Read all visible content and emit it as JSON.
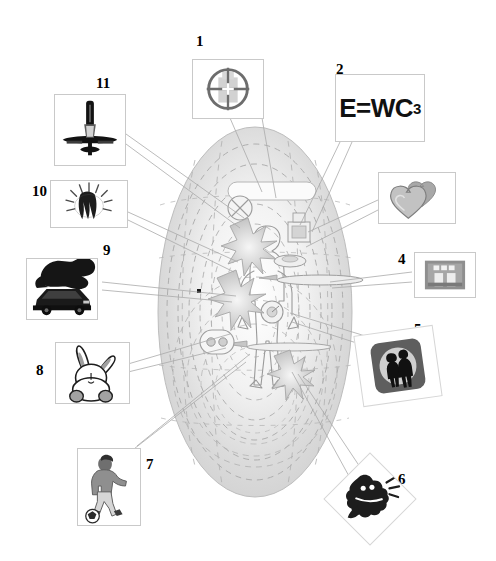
{
  "diagram": {
    "center": {
      "name": "human-figure-oval-field",
      "description": "Faint human figure standing inside nested dashed oval rings with small embedded icons and starburst impact marks"
    },
    "colors": {
      "background": "#ffffff",
      "line": "#9aa0a6",
      "frame_border": "#c9c9c9",
      "oval_fill": "#d8d8d8",
      "oval_dash": "#9f9f9f",
      "number_text": "#000000",
      "dark_ink": "#1a1a1a",
      "mid_gray": "#8d8d8d"
    },
    "callouts": [
      {
        "number": "1",
        "name": "crosshair-scope",
        "icon": "crosshair-icon",
        "label": "1"
      },
      {
        "number": "2",
        "name": "formula-panel",
        "icon": "formula-text",
        "label": "2",
        "formula_main": "E=WC",
        "formula_sub": "3"
      },
      {
        "number": "3",
        "name": "twin-hearts",
        "icon": "hearts-icon",
        "label": "3"
      },
      {
        "number": "4",
        "name": "grayscale-photo",
        "icon": "photo-icon",
        "label": "4"
      },
      {
        "number": "5",
        "name": "couple-silhouette-badge",
        "icon": "people-badge-icon",
        "label": "5"
      },
      {
        "number": "6",
        "name": "struck-figure",
        "icon": "impact-figure-icon",
        "label": "6"
      },
      {
        "number": "7",
        "name": "soccer-player",
        "icon": "soccer-player-icon",
        "label": "7"
      },
      {
        "number": "8",
        "name": "rabbit",
        "icon": "rabbit-icon",
        "label": "8"
      },
      {
        "number": "9",
        "name": "burning-car",
        "icon": "burning-car-icon",
        "label": "9"
      },
      {
        "number": "10",
        "name": "radiating-burst",
        "icon": "burst-icon",
        "label": "10"
      },
      {
        "number": "11",
        "name": "airplane-top-view",
        "icon": "airplane-icon",
        "label": "11"
      }
    ]
  }
}
